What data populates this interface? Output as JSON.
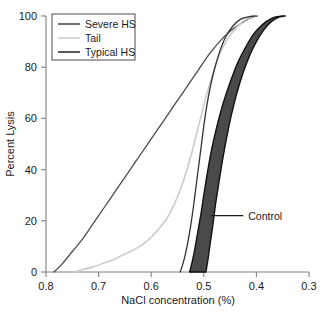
{
  "chart_data": {
    "type": "line",
    "title": "",
    "xlabel": "NaCl concentration (%)",
    "ylabel": "Percent Lysis",
    "xlim": [
      0.8,
      0.3
    ],
    "ylim": [
      0,
      100
    ],
    "x_reversed": true,
    "grid": false,
    "x_ticks": [
      0.8,
      0.7,
      0.6,
      0.5,
      0.4,
      0.3
    ],
    "x_tick_labels": [
      "0.8",
      "0.7",
      "0.6",
      "0.5",
      "0.4",
      "0.3"
    ],
    "y_ticks": [
      0,
      20,
      40,
      60,
      80,
      100
    ],
    "y_tick_labels": [
      "0",
      "20",
      "40",
      "60",
      "80",
      "100"
    ],
    "legend": {
      "position": "top-left",
      "entries": [
        {
          "name": "Severe HS",
          "color": "#4d4d4d"
        },
        {
          "name": "Tail",
          "color": "#cccccc"
        },
        {
          "name": "Typical HS",
          "color": "#333333"
        }
      ]
    },
    "annotations": [
      {
        "text": "Control",
        "target_x": 0.487,
        "target_y": 22,
        "label_x": 0.425,
        "label_y": 22
      }
    ],
    "series": [
      {
        "name": "Severe HS",
        "color": "#4d4d4d",
        "x": [
          0.785,
          0.77,
          0.75,
          0.73,
          0.71,
          0.69,
          0.67,
          0.65,
          0.63,
          0.61,
          0.59,
          0.57,
          0.55,
          0.53,
          0.51,
          0.49,
          0.47,
          0.45,
          0.43,
          0.415,
          0.405,
          0.398
        ],
        "y": [
          0,
          3,
          8,
          13,
          19,
          25,
          31,
          37,
          43,
          49,
          55,
          61,
          67,
          73,
          79,
          85,
          90,
          94,
          97,
          99,
          99.7,
          100
        ]
      },
      {
        "name": "Tail",
        "color": "#cccccc",
        "x": [
          0.745,
          0.73,
          0.71,
          0.69,
          0.67,
          0.65,
          0.63,
          0.615,
          0.6,
          0.585,
          0.57,
          0.555,
          0.545,
          0.535,
          0.525,
          0.515,
          0.505,
          0.495,
          0.485,
          0.47,
          0.455,
          0.44,
          0.425,
          0.412,
          0.402
        ],
        "y": [
          0,
          1,
          2,
          3.5,
          5,
          7,
          9,
          11,
          13.5,
          17,
          21,
          27,
          32,
          38,
          45,
          53,
          61,
          69,
          76,
          85,
          91,
          95,
          98,
          99.5,
          100
        ]
      },
      {
        "name": "Typical HS",
        "color": "#333333",
        "x": [
          0.545,
          0.54,
          0.535,
          0.53,
          0.525,
          0.52,
          0.515,
          0.51,
          0.505,
          0.5,
          0.495,
          0.488,
          0.48,
          0.47,
          0.458,
          0.445,
          0.432,
          0.42,
          0.41,
          0.402
        ],
        "y": [
          0,
          3,
          7,
          12,
          18,
          25,
          33,
          41,
          49,
          57,
          64,
          72,
          79,
          86,
          92,
          96,
          98.5,
          99.5,
          99.9,
          100
        ]
      }
    ],
    "bands": [
      {
        "name": "Control",
        "fill": "#4a4a4a",
        "stroke": "#111111",
        "lower_x": [
          0.527,
          0.522,
          0.517,
          0.512,
          0.506,
          0.5,
          0.493,
          0.485,
          0.475,
          0.463,
          0.45,
          0.435,
          0.42,
          0.405,
          0.392,
          0.38,
          0.37,
          0.362,
          0.355,
          0.35
        ],
        "lower_y": [
          0,
          4,
          9,
          15,
          22,
          30,
          39,
          48,
          57,
          66,
          74,
          82,
          88,
          93,
          96,
          98,
          99.2,
          99.7,
          99.9,
          100
        ],
        "upper_x": [
          0.496,
          0.492,
          0.488,
          0.483,
          0.478,
          0.472,
          0.465,
          0.457,
          0.448,
          0.437,
          0.425,
          0.412,
          0.4,
          0.388,
          0.377,
          0.368,
          0.36,
          0.353,
          0.348,
          0.345
        ],
        "upper_y": [
          0,
          5,
          11,
          18,
          26,
          34,
          43,
          52,
          61,
          70,
          78,
          85,
          90,
          94,
          96.8,
          98.4,
          99.3,
          99.8,
          99.95,
          100
        ]
      }
    ]
  },
  "axes": {
    "y_title": "Percent Lysis",
    "x_title": "NaCl concentration (%)"
  },
  "legend": {
    "items": [
      {
        "label": "Severe HS"
      },
      {
        "label": "Tail"
      },
      {
        "label": "Typical HS"
      }
    ]
  },
  "annotation": {
    "control_label": "Control"
  },
  "ticks": {
    "x": [
      "0.8",
      "0.7",
      "0.6",
      "0.5",
      "0.4",
      "0.3"
    ],
    "y": [
      "0",
      "20",
      "40",
      "60",
      "80",
      "100"
    ]
  },
  "colors": {
    "severe_hs": "#4d4d4d",
    "tail": "#cccccc",
    "typical_hs": "#333333",
    "control_fill": "#4a4a4a",
    "control_stroke": "#111111",
    "axis": "#808080",
    "text": "#1a1a1a"
  }
}
